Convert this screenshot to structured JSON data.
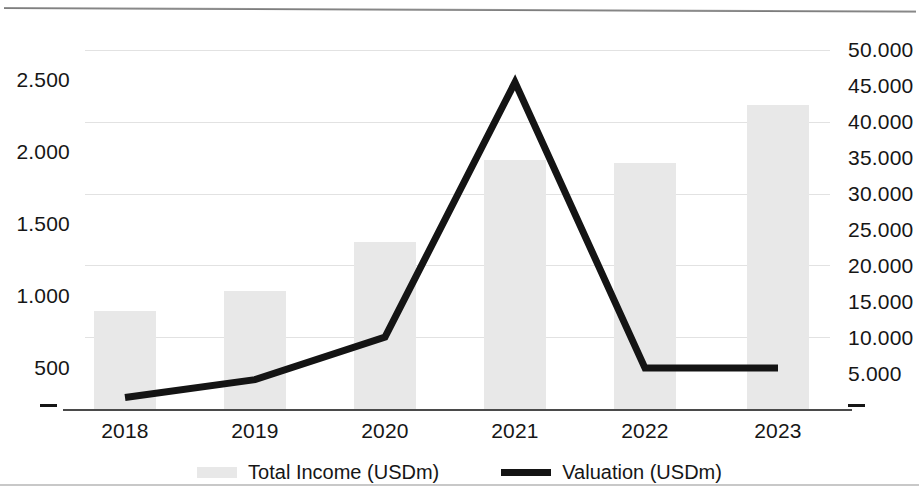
{
  "chart_data": {
    "type": "bar",
    "title": "",
    "subtitle": "",
    "xlabel": "",
    "categories": [
      "2018",
      "2019",
      "2020",
      "2021",
      "2022",
      "2023"
    ],
    "series": [
      {
        "name": "Total Income (USDm)",
        "type": "bar",
        "axis": "left",
        "color": "#e8e8e8",
        "values": [
          680,
          825,
          1160,
          1735,
          1715,
          2120
        ]
      },
      {
        "name": "Valuation (USDm)",
        "type": "line",
        "axis": "right",
        "color": "#141414",
        "values": [
          1600,
          4100,
          10000,
          45500,
          5700,
          5700
        ]
      }
    ],
    "left_axis": {
      "label": "",
      "ylim": [
        0,
        2500
      ],
      "ticks": [
        0,
        500,
        1000,
        1500,
        2000,
        2500
      ],
      "tick_labels": [
        "–",
        "500",
        "1.000",
        "1.500",
        "2.000",
        "2.500"
      ]
    },
    "right_axis": {
      "label": "",
      "ylim": [
        0,
        50000
      ],
      "ticks": [
        0,
        5000,
        10000,
        15000,
        20000,
        25000,
        30000,
        35000,
        40000,
        45000,
        50000
      ],
      "tick_labels": [
        "–",
        "5.000",
        "10.000",
        "15.000",
        "20.000",
        "25.000",
        "30.000",
        "35.000",
        "40.000",
        "45.000",
        "50.000"
      ]
    },
    "grid": {
      "horizontal": true,
      "vertical": false,
      "color": "#e2e2e2",
      "at_left_ticks": [
        500,
        1000,
        1500,
        2000,
        2500
      ]
    },
    "legend": {
      "position": "bottom",
      "entries": [
        {
          "label": "Total Income (USDm)",
          "marker": "bar-swatch",
          "color": "#e8e8e8"
        },
        {
          "label": "Valuation (USDm)",
          "marker": "line-swatch",
          "color": "#141414"
        }
      ]
    }
  },
  "axis_left": {
    "t0": "–",
    "t1": "500",
    "t2": "1.000",
    "t3": "1.500",
    "t4": "2.000",
    "t5": "2.500"
  },
  "axis_right": {
    "t0": "–",
    "t1": "5.000",
    "t2": "10.000",
    "t3": "15.000",
    "t4": "20.000",
    "t5": "25.000",
    "t6": "30.000",
    "t7": "35.000",
    "t8": "40.000",
    "t9": "45.000",
    "t10": "50.000"
  },
  "x_axis": {
    "c0": "2018",
    "c1": "2019",
    "c2": "2020",
    "c3": "2021",
    "c4": "2022",
    "c5": "2023"
  },
  "legend": {
    "income_label": "Total Income (USDm)",
    "valuation_label": "Valuation (USDm)"
  }
}
